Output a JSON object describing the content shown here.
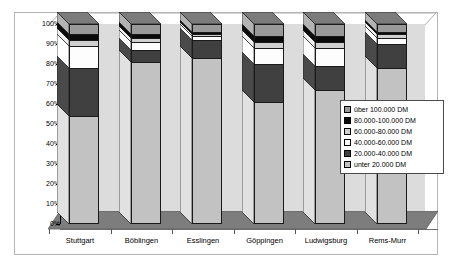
{
  "chart_data": {
    "type": "bar",
    "subtype": "100% stacked column, 3D",
    "title": "",
    "xlabel": "",
    "ylabel": "",
    "ylim": [
      0,
      100
    ],
    "grid": false,
    "legend_position": "center-right",
    "categories": [
      "Stuttgart",
      "Böblingen",
      "Esslingen",
      "Göppingen",
      "Ludwigsburg",
      "Rems-Murr"
    ],
    "ytick_labels": [
      "100%",
      "90%",
      "80%",
      "70%",
      "60%",
      "50%",
      "40%",
      "30%",
      "20%",
      "10%",
      "0%"
    ],
    "ytick_values": [
      100,
      90,
      80,
      70,
      60,
      50,
      40,
      30,
      20,
      10,
      0
    ],
    "series": [
      {
        "name": "unter 20.000 DM",
        "color": "#c2c2c2",
        "values": [
          54,
          81,
          83,
          61,
          67,
          78
        ]
      },
      {
        "name": "20.000-40.000 DM",
        "color": "#404040",
        "values": [
          24,
          6,
          9,
          19,
          12,
          12
        ]
      },
      {
        "name": "40.000-60.000 DM",
        "color": "#fdfdfd",
        "values": [
          11,
          4,
          2,
          8,
          9,
          3
        ]
      },
      {
        "name": "60.000-80.000 DM",
        "color": "#cfcfcf",
        "values": [
          3,
          2,
          1,
          3,
          3,
          2
        ]
      },
      {
        "name": "80.000-100.000 DM",
        "color": "#0a0a0a",
        "values": [
          3,
          2,
          1,
          3,
          3,
          1
        ]
      },
      {
        "name": "über 100.000 DM",
        "color": "#9a9a9a",
        "values": [
          5,
          5,
          4,
          6,
          6,
          4
        ]
      }
    ]
  },
  "legend": {
    "items": [
      {
        "label": "über 100.000 DM",
        "color": "#9a9a9a"
      },
      {
        "label": "80.000-100.000 DM",
        "color": "#0a0a0a"
      },
      {
        "label": "60.000-80.000 DM",
        "color": "#cfcfcf"
      },
      {
        "label": "40.000-60.000 DM",
        "color": "#fdfdfd"
      },
      {
        "label": "20.000-40.000 DM",
        "color": "#404040"
      },
      {
        "label": "unter 20.000 DM",
        "color": "#c2c2c2"
      }
    ]
  },
  "colors": {
    "back_wall": "#dcdcdc",
    "floor": "#7d7d7d",
    "frame_border": "#b4b4b4",
    "axis": "#000000",
    "page_background": "#ffffff"
  }
}
